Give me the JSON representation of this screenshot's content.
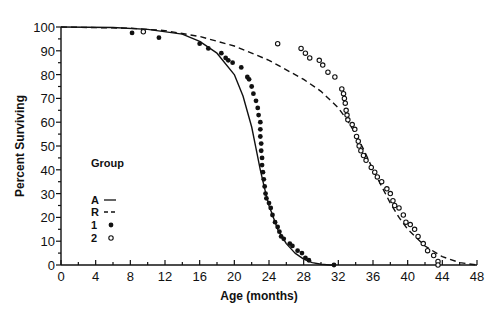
{
  "chart_data": {
    "type": "scatter",
    "title": "",
    "xlabel": "Age (months)",
    "ylabel": "Percent Surviving",
    "xlim": [
      0,
      48
    ],
    "ylim": [
      0,
      100
    ],
    "xticks": [
      0,
      4,
      8,
      12,
      16,
      20,
      24,
      28,
      32,
      36,
      40,
      44,
      48
    ],
    "yticks": [
      0,
      10,
      20,
      30,
      40,
      50,
      60,
      70,
      80,
      90,
      100
    ],
    "grid": false,
    "legend": {
      "title": "Group",
      "position": "left-middle",
      "entries": [
        {
          "label": "A",
          "marker": "solid-line"
        },
        {
          "label": "R",
          "marker": "dashed-line"
        },
        {
          "label": "1",
          "marker": "filled-circle"
        },
        {
          "label": "2",
          "marker": "open-circle"
        }
      ]
    },
    "series": [
      {
        "name": "A",
        "style": "solid",
        "x": [
          0,
          6,
          10,
          14,
          16,
          18,
          20,
          21,
          22,
          22.5,
          23,
          23.5,
          24,
          25,
          26,
          27,
          28,
          29,
          30,
          31,
          31.5
        ],
        "y": [
          100,
          99.8,
          99,
          97,
          94,
          89,
          80,
          71,
          58,
          49,
          40,
          32,
          25,
          15,
          9,
          5,
          2.5,
          1,
          0.3,
          0,
          0
        ]
      },
      {
        "name": "R",
        "style": "dashed",
        "x": [
          0,
          8,
          12,
          16,
          20,
          24,
          28,
          30,
          32,
          33,
          34,
          35,
          36,
          37,
          38,
          39,
          40,
          42,
          44,
          46,
          48
        ],
        "y": [
          100,
          99.5,
          98.5,
          96,
          92,
          86,
          78,
          73,
          66,
          61,
          55,
          48,
          40,
          33,
          26,
          20,
          15,
          8,
          3.5,
          1,
          0
        ]
      },
      {
        "name": "1",
        "marker": "filled",
        "x": [
          8.2,
          11.3,
          16,
          17,
          18.5,
          19,
          19.3,
          19.8,
          20.8,
          21.5,
          21.7,
          22,
          22.2,
          22.5,
          22.7,
          22.8,
          23,
          23,
          23,
          23.1,
          23.1,
          23.2,
          23.2,
          23.3,
          23.4,
          23.5,
          23.6,
          23.7,
          24,
          24.2,
          24.4,
          24.7,
          25,
          25.2,
          25.4,
          25.7,
          26.4,
          26.7,
          27.3,
          27.8,
          28.2,
          28.6,
          31.5
        ],
        "y": [
          97.5,
          95.5,
          93,
          91,
          89,
          87,
          86,
          85,
          83,
          79,
          78,
          75,
          72,
          69,
          66,
          63,
          60,
          57,
          54,
          51,
          48,
          45,
          42,
          39,
          36,
          33,
          30,
          28,
          26,
          24,
          21,
          18,
          16,
          14,
          12,
          11,
          9,
          8,
          6,
          5,
          3,
          2,
          0
        ]
      },
      {
        "name": "2",
        "marker": "open",
        "x": [
          9.5,
          25,
          27.7,
          28.2,
          28.7,
          29.8,
          30.2,
          30.8,
          31.6,
          32.4,
          32.6,
          32.7,
          32.8,
          32.9,
          33,
          33.1,
          33.6,
          33.9,
          34.1,
          34.3,
          34.4,
          34.6,
          34.9,
          35.2,
          35.8,
          36.2,
          36.5,
          37,
          37.6,
          38,
          38.3,
          38.5,
          39,
          39.5,
          39.8,
          40.3,
          40.8,
          41.2,
          41.8,
          42.3,
          43,
          43.5,
          43.5
        ],
        "y": [
          98,
          93,
          91,
          89,
          87,
          86,
          84,
          81,
          79,
          74,
          72,
          70,
          68,
          65,
          63,
          61,
          59,
          57,
          54,
          52,
          50,
          48,
          46,
          44,
          41,
          39,
          37,
          35,
          32,
          30,
          27,
          25,
          24,
          21,
          18,
          17,
          15,
          12,
          9,
          6,
          4,
          1.5,
          0
        ]
      }
    ]
  },
  "legend_title": "Group",
  "legend_labels": [
    "A",
    "R",
    "1",
    "2"
  ]
}
